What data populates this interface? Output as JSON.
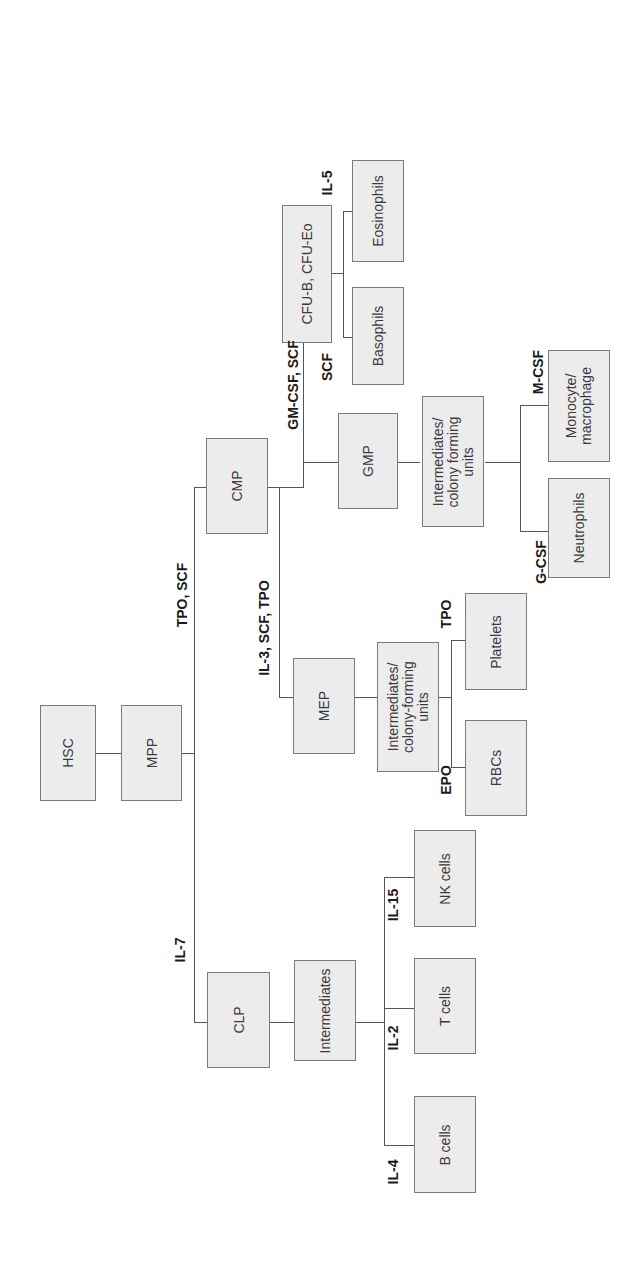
{
  "diagram": {
    "orientation": "rotated -90 degrees",
    "nodes": {
      "hsc": "HSC",
      "mpp": "MPP",
      "cmp": "CMP",
      "clp": "CLP",
      "mep": "MEP",
      "gmp": "GMP",
      "cfu_b_eo": "CFU-B, CFU-Eo",
      "eosinophils": "Eosinophils",
      "basophils": "Basophils",
      "gmp_intermediates": "Intermediates/\ncolony forming\nunits",
      "monocyte": "Monocyte/\nmacrophage",
      "neutrophils": "Neutrophils",
      "mep_intermediates": "Intermediates/\ncolony-forming\nunits",
      "platelets": "Platelets",
      "rbcs": "RBCs",
      "lymph_intermediates": "Intermediates",
      "nk_cells": "NK cells",
      "t_cells": "T cells",
      "b_cells": "B cells"
    },
    "cytokines": {
      "tpo_scf": "TPO, SCF",
      "gm_csf_scf": "GM-CSF, SCF",
      "il3_scf_tpo": "IL-3, SCF, TPO",
      "il7": "IL-7",
      "il5": "IL-5",
      "scf": "SCF",
      "m_csf": "M-CSF",
      "g_csf": "G-CSF",
      "tpo": "TPO",
      "epo": "EPO",
      "il15": "IL-15",
      "il2": "IL-2",
      "il4": "IL-4"
    },
    "colors": {
      "box_fill": "#ececec",
      "box_border": "#7a7a7a",
      "line": "#555555",
      "text": "#3a3a3a"
    }
  }
}
